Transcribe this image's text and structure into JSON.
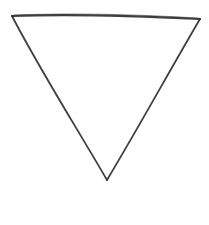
{
  "diagram": {
    "shape": "inverted-triangle",
    "style": "hand-drawn",
    "stroke_color": "#2b2b2b",
    "background": "#ffffff",
    "vertices": {
      "top_left": [
        12,
        16
      ],
      "top_right": [
        200,
        19
      ],
      "bottom": [
        107,
        180
      ]
    }
  }
}
